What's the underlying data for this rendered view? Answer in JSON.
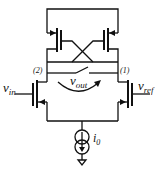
{
  "diagram": {
    "type": "circuit-schematic",
    "labels": {
      "vin_main": "v",
      "vin_sub": "in",
      "vref_main": "v",
      "vref_sub": "ref",
      "vout_main": "v",
      "vout_sub": "out",
      "node1": "(1)",
      "node2": "(2)",
      "i0_main": "i",
      "i0_sub": "0"
    },
    "components": [
      "pmos-left",
      "pmos-right",
      "nmos-input-left",
      "nmos-input-right",
      "reset-switch",
      "tail-current-source",
      "ground"
    ]
  }
}
